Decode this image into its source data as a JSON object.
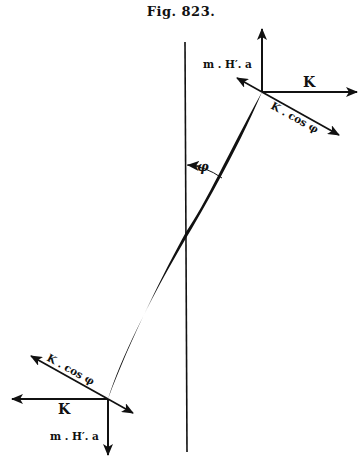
{
  "figure": {
    "title": "Fig. 823.",
    "labels": {
      "top_vertical": "m . H′. a",
      "top_horizontal": "K",
      "top_oblique": "K . cos φ",
      "angle": "φ",
      "bottom_oblique": "K . cos φ",
      "bottom_horizontal": "K",
      "bottom_vertical": "m . H′. a"
    },
    "colors": {
      "ink": "#111111",
      "background": "#ffffff"
    }
  }
}
